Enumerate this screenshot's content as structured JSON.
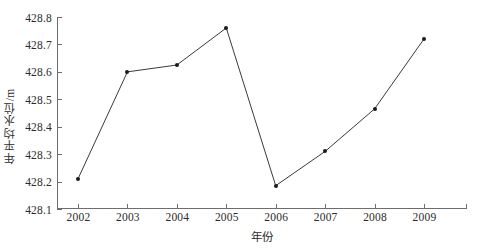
{
  "chart_data": {
    "type": "line",
    "title": "",
    "xlabel": "年份",
    "ylabel": "年平均水位/m",
    "categories": [
      "2002",
      "2003",
      "2004",
      "2005",
      "2006",
      "2007",
      "2008",
      "2009"
    ],
    "x": [
      2002,
      2003,
      2004,
      2005,
      2006,
      2007,
      2008,
      2009
    ],
    "values": [
      428.21,
      428.6,
      428.625,
      428.76,
      428.185,
      428.31,
      428.465,
      428.72
    ],
    "series": [
      {
        "name": "年平均水位",
        "values": [
          428.21,
          428.6,
          428.625,
          428.76,
          428.185,
          428.31,
          428.465,
          428.72
        ]
      }
    ],
    "ylim": [
      428.1,
      428.8
    ],
    "yticks": [
      "428.1",
      "428.2",
      "428.3",
      "428.4",
      "428.5",
      "428.6",
      "428.7",
      "428.8"
    ],
    "ytick_values": [
      428.1,
      428.2,
      428.3,
      428.4,
      428.5,
      428.6,
      428.7,
      428.8
    ],
    "xtick_labels": [
      "2002",
      "2003",
      "2004",
      "2005",
      "2006",
      "2007",
      "2008",
      "2009"
    ],
    "grid": false,
    "legend": null,
    "legend_position": "none",
    "line_color": "#3a3a3a",
    "marker_color": "#1a1a1a",
    "axis_color": "#6d6d6d"
  },
  "caption": {
    "text": ""
  }
}
